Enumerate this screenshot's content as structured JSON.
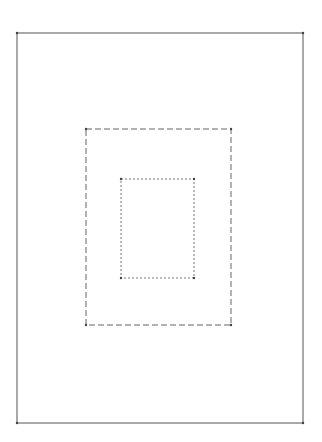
{
  "diagram": {
    "background": "#ffffff",
    "stroke_color": "#555555",
    "rectangles": [
      {
        "name": "outer",
        "style": "solid",
        "x": 17,
        "y": 33,
        "width": 286,
        "height": 390
      },
      {
        "name": "middle",
        "style": "dashed",
        "x": 86,
        "y": 129,
        "width": 145,
        "height": 196
      },
      {
        "name": "inner",
        "style": "dotted",
        "x": 121,
        "y": 179,
        "width": 73,
        "height": 99
      }
    ]
  }
}
